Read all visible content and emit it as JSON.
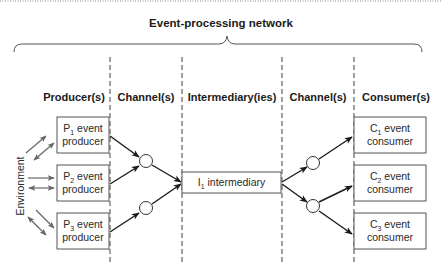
{
  "title": "Event-processing network",
  "columns": [
    {
      "id": "producers",
      "label": "Producer(s)"
    },
    {
      "id": "channels-in",
      "label": "Channel(s)"
    },
    {
      "id": "intermediaries",
      "label": "Intermediary(ies)"
    },
    {
      "id": "channels-out",
      "label": "Channel(s)"
    },
    {
      "id": "consumers",
      "label": "Consumer(s)"
    }
  ],
  "environment": {
    "label": "Environment"
  },
  "producers": [
    {
      "letter": "P",
      "index": "1",
      "line1": " event",
      "line2": "producer"
    },
    {
      "letter": "P",
      "index": "2",
      "line1": " event",
      "line2": "producer"
    },
    {
      "letter": "P",
      "index": "3",
      "line1": " event",
      "line2": "producer"
    }
  ],
  "intermediaries": [
    {
      "letter": "I",
      "index": "1",
      "line1": " intermediary"
    }
  ],
  "consumers": [
    {
      "letter": "C",
      "index": "1",
      "line1": " event",
      "line2": "consumer"
    },
    {
      "letter": "C",
      "index": "2",
      "line1": " event",
      "line2": "consumer"
    },
    {
      "letter": "C",
      "index": "3",
      "line1": " event",
      "line2": "consumer"
    }
  ],
  "edges": [
    {
      "from": "P1",
      "to": "channel-in-1"
    },
    {
      "from": "P2",
      "to": "channel-in-1"
    },
    {
      "from": "P3",
      "to": "channel-in-2"
    },
    {
      "from": "channel-in-1",
      "to": "I1"
    },
    {
      "from": "channel-in-2",
      "to": "I1"
    },
    {
      "from": "I1",
      "to": "channel-out-1"
    },
    {
      "from": "I1",
      "to": "channel-out-2"
    },
    {
      "from": "channel-out-1",
      "to": "C1"
    },
    {
      "from": "channel-out-2",
      "to": "C2"
    },
    {
      "from": "channel-out-2",
      "to": "C3"
    }
  ],
  "colors": {
    "line": "#1a1a1a",
    "environment_arrows": "#666666",
    "box_border": "#555555"
  }
}
